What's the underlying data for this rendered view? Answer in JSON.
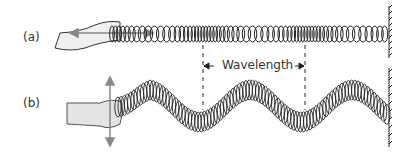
{
  "figure": {
    "panel_a": {
      "label": "(a)",
      "description": "longitudinal wave on spring, hand pushes back and forth"
    },
    "panel_b": {
      "label": "(b)",
      "description": "transverse wave on spring, hand moves up and down"
    },
    "wavelength_label": "Wavelength"
  }
}
